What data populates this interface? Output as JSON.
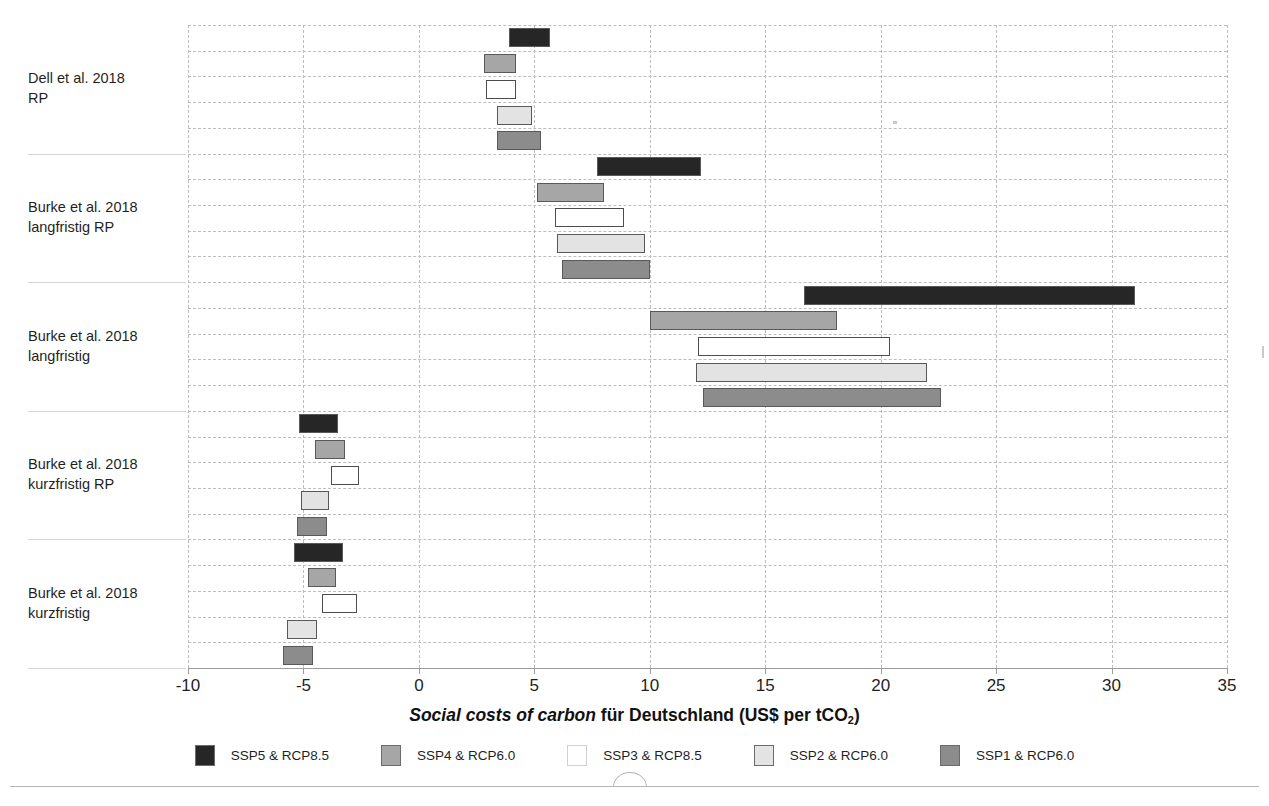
{
  "axis": {
    "x_title_italic": "Social costs of carbon",
    "x_title_rest": " für Deutschland  (US$ per tCO",
    "x_title_sub": "2",
    "x_title_close": ")",
    "ticks": [
      "-10",
      "-5",
      "0",
      "5",
      "10",
      "15",
      "20",
      "25",
      "30",
      "35"
    ]
  },
  "legend": {
    "items": [
      {
        "label": "SSP5 & RCP8.5",
        "color": "#262626"
      },
      {
        "label": "SSP4 & RCP6.0",
        "color": "#a6a6a6"
      },
      {
        "label": "SSP3 & RCP8.5",
        "color": "#ffffff"
      },
      {
        "label": "SSP2 & RCP6.0",
        "color": "#e3e3e3"
      },
      {
        "label": "SSP1 & RCP6.0",
        "color": "#8c8c8c"
      }
    ]
  },
  "categories": [
    "Dell et al. 2018\nRP",
    "Burke et al. 2018\nlangfristig RP",
    "Burke et al. 2018\nlangfristig",
    "Burke et al. 2018\nkurzfristig RP",
    "Burke et al. 2018\nkurzfristig"
  ],
  "chart_data": {
    "type": "bar",
    "orientation": "horizontal-floating-range",
    "title": "",
    "xlabel": "Social costs of carbon für Deutschland (US$ per tCO2)",
    "ylabel": "",
    "xlim": [
      -10,
      35
    ],
    "xticks": [
      -10,
      -5,
      0,
      5,
      10,
      15,
      20,
      25,
      30,
      35
    ],
    "grid": true,
    "legend_position": "bottom",
    "categories": [
      "Dell et al. 2018 RP",
      "Burke et al. 2018 langfristig RP",
      "Burke et al. 2018 langfristig",
      "Burke et al. 2018 kurzfristig RP",
      "Burke et al. 2018 kurzfristig"
    ],
    "series": [
      {
        "name": "SSP5 & RCP8.5",
        "color": "#262626",
        "ranges": [
          [
            3.9,
            5.7
          ],
          [
            7.7,
            12.2
          ],
          [
            16.7,
            31.0
          ],
          [
            -5.2,
            -3.5
          ],
          [
            -5.4,
            -3.3
          ]
        ]
      },
      {
        "name": "SSP4 & RCP6.0",
        "color": "#a6a6a6",
        "ranges": [
          [
            2.8,
            4.2
          ],
          [
            5.1,
            8.0
          ],
          [
            10.0,
            18.1
          ],
          [
            -4.5,
            -3.2
          ],
          [
            -4.8,
            -3.6
          ]
        ]
      },
      {
        "name": "SSP3 & RCP8.5",
        "color": "#ffffff",
        "ranges": [
          [
            2.9,
            4.2
          ],
          [
            5.9,
            8.9
          ],
          [
            12.1,
            20.4
          ],
          [
            -3.8,
            -2.6
          ],
          [
            -4.2,
            -2.7
          ]
        ]
      },
      {
        "name": "SSP2 & RCP6.0",
        "color": "#e3e3e3",
        "ranges": [
          [
            3.4,
            4.9
          ],
          [
            6.0,
            9.8
          ],
          [
            12.0,
            22.0
          ],
          [
            -5.1,
            -3.9
          ],
          [
            -5.7,
            -4.4
          ]
        ]
      },
      {
        "name": "SSP1 & RCP6.0",
        "color": "#8c8c8c",
        "ranges": [
          [
            3.4,
            5.3
          ],
          [
            6.2,
            10.0
          ],
          [
            12.3,
            22.6
          ],
          [
            -5.3,
            -4.0
          ],
          [
            -5.9,
            -4.6
          ]
        ]
      }
    ]
  }
}
